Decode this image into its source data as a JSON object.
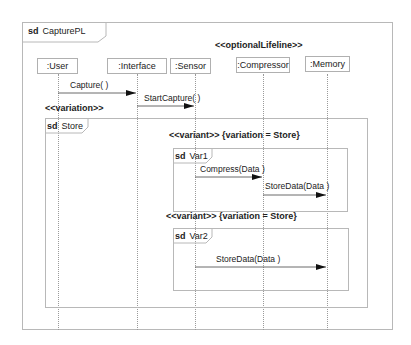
{
  "diagram": {
    "type": "sequence",
    "frame": {
      "keyword": "sd",
      "name": "CapturePL"
    },
    "stereotype_optional": "<<optionalLifeline>>",
    "lifelines": [
      {
        "id": "user",
        "label": ":User"
      },
      {
        "id": "interface",
        "label": ":Interface"
      },
      {
        "id": "sensor",
        "label": ":Sensor"
      },
      {
        "id": "compressor",
        "label": ":Compressor"
      },
      {
        "id": "memory",
        "label": ":Memory"
      }
    ],
    "messages": [
      {
        "label": "Capture( )",
        "from": ":User",
        "to": ":Interface"
      },
      {
        "label": "StartCapture( )",
        "from": ":Interface",
        "to": ":Sensor"
      }
    ],
    "variation": {
      "stereotype": "<<variation>>",
      "keyword": "sd",
      "name": "Store",
      "variants": [
        {
          "stereotype": "<<variant>>",
          "constraint": "{variation = Store}",
          "keyword": "sd",
          "name": "Var1",
          "messages": [
            {
              "label": "Compress(Data )",
              "from": ":Sensor",
              "to": ":Compressor"
            },
            {
              "label": "StoreData(Data )",
              "from": ":Compressor",
              "to": ":Memory"
            }
          ]
        },
        {
          "stereotype": "<<variant>>",
          "constraint": "{variation = Store}",
          "keyword": "sd",
          "name": "Var2",
          "messages": [
            {
              "label": "StoreData(Data )",
              "from": ":Sensor",
              "to": ":Memory"
            }
          ]
        }
      ]
    }
  }
}
